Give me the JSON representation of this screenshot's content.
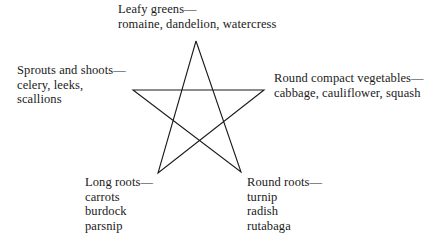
{
  "diagram": {
    "type": "pentagram",
    "stroke_color": "#1a1a1a",
    "vertices": {
      "top": [
        196,
        41
      ],
      "upper_left": [
        133,
        90
      ],
      "upper_right": [
        264,
        90
      ],
      "lower_left": [
        158,
        173
      ],
      "lower_right": [
        241,
        172
      ]
    },
    "categories": [
      {
        "title": "Leafy greens—",
        "items": [
          "romaine, dandelion, watercress"
        ]
      },
      {
        "title": "Sprouts and shoots—",
        "items": [
          "celery, leeks,",
          "scallions"
        ]
      },
      {
        "title": "Round compact vegetables—",
        "items": [
          "cabbage, cauliflower, squash"
        ]
      },
      {
        "title": "Long roots—",
        "items": [
          "carrots",
          "burdock",
          "parsnip"
        ]
      },
      {
        "title": "Round roots—",
        "items": [
          "turnip",
          "radish",
          "rutabaga"
        ]
      }
    ]
  }
}
